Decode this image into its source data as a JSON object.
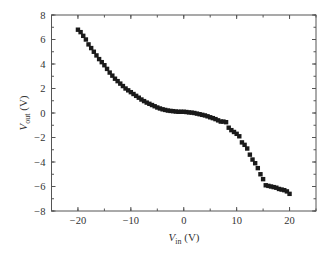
{
  "chart_data": {
    "type": "scatter",
    "title": "",
    "xlabel": "V_in (V)",
    "ylabel": "V_out (V)",
    "xlabel_parts": {
      "main": "V",
      "sub": "in",
      "unit": " (V)"
    },
    "ylabel_parts": {
      "main": "V",
      "sub": "out",
      "unit": " (V)"
    },
    "xlim": [
      -25,
      25
    ],
    "ylim": [
      -8,
      8
    ],
    "xticks": [
      -20,
      -10,
      0,
      10,
      20
    ],
    "xtick_labels": [
      "−20",
      "−10",
      "0",
      "10",
      "20"
    ],
    "xminor_step": 5,
    "yticks": [
      -8,
      -6,
      -4,
      -2,
      0,
      2,
      4,
      6,
      8
    ],
    "ytick_labels": [
      "−8",
      "−6",
      "−4",
      "−2",
      "0",
      "2",
      "4",
      "6",
      "8"
    ],
    "yminor_step": 1,
    "grid": false,
    "legend": null,
    "marker": "square",
    "marker_color": "#1a1a1a",
    "series": [
      {
        "name": "V_out vs V_in",
        "x": [
          -20,
          -19.5,
          -19,
          -18.5,
          -18,
          -17.5,
          -17,
          -16.5,
          -16,
          -15.5,
          -15,
          -14.5,
          -14,
          -13.5,
          -13,
          -12.5,
          -12,
          -11.5,
          -11,
          -10.5,
          -10,
          -9.5,
          -9,
          -8.5,
          -8,
          -7.5,
          -7,
          -6.5,
          -6,
          -5.5,
          -5,
          -4.5,
          -4,
          -3.5,
          -3,
          -2.5,
          -2,
          -1.5,
          -1,
          -0.5,
          0,
          0.5,
          1,
          1.5,
          2,
          2.5,
          3,
          3.5,
          4,
          4.5,
          5,
          5.5,
          6,
          6.5,
          7,
          7.5,
          8,
          8.5,
          9,
          9.5,
          10,
          10.5,
          11,
          11.5,
          12,
          12.5,
          13,
          13.5,
          14,
          14.5,
          15,
          15.5,
          16,
          16.5,
          17,
          17.5,
          18,
          18.5,
          19,
          19.5,
          20
        ],
        "y": [
          6.8,
          6.6,
          6.3,
          6.0,
          5.6,
          5.3,
          5.0,
          4.7,
          4.4,
          4.15,
          3.9,
          3.6,
          3.3,
          3.05,
          2.8,
          2.6,
          2.4,
          2.2,
          2.0,
          1.85,
          1.7,
          1.55,
          1.4,
          1.25,
          1.1,
          0.97,
          0.85,
          0.75,
          0.65,
          0.55,
          0.45,
          0.37,
          0.3,
          0.25,
          0.2,
          0.17,
          0.15,
          0.12,
          0.1,
          0.1,
          0.1,
          0.08,
          0.05,
          0.03,
          0.0,
          -0.05,
          -0.1,
          -0.15,
          -0.2,
          -0.27,
          -0.35,
          -0.42,
          -0.5,
          -0.6,
          -0.7,
          -0.7,
          -0.75,
          -1.2,
          -1.4,
          -1.55,
          -1.7,
          -1.9,
          -2.4,
          -2.6,
          -2.9,
          -3.4,
          -3.8,
          -4.1,
          -4.5,
          -5.0,
          -5.4,
          -5.9,
          -5.95,
          -6.0,
          -6.05,
          -6.1,
          -6.2,
          -6.25,
          -6.3,
          -6.4,
          -6.6
        ]
      }
    ]
  }
}
